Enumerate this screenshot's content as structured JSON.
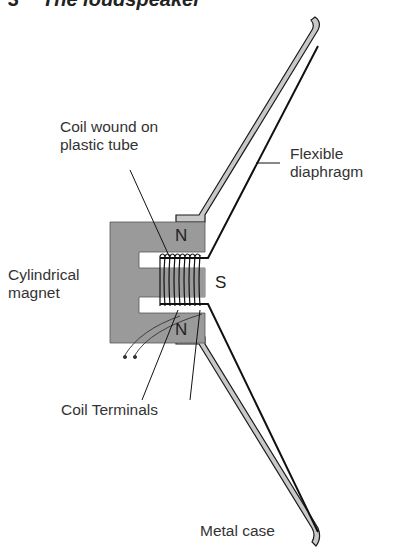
{
  "figure": {
    "number": "3",
    "title": "The loudspeaker"
  },
  "labels": {
    "coil_line1": "Coil wound on",
    "coil_line2": "plastic tube",
    "diaphragm_line1": "Flexible",
    "diaphragm_line2": "diaphragm",
    "magnet_line1": "Cylindrical",
    "magnet_line2": "magnet",
    "coil_terminals_a": "Coil",
    "coil_terminals_b": "Terminals",
    "metal_case": "Metal case"
  },
  "poles": {
    "top": "N",
    "center": "S",
    "bottom": "N"
  },
  "colors": {
    "magnet_fill": "#9a9a9a",
    "case_fill": "#c8c8c8",
    "line": "#1a1a1a",
    "text": "#333333"
  }
}
